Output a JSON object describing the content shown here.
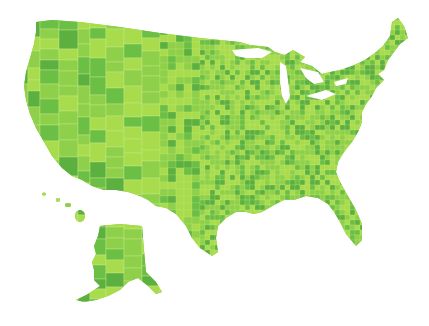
{
  "map": {
    "subject": "United States counties choropleth",
    "colors": {
      "background": "#ffffff",
      "light": "#a8dc4c",
      "mid": "#8fd04a",
      "dark": "#6cbf45",
      "darker": "#5cb040",
      "border": "#c8ec8a"
    },
    "regions": [
      "contiguous-us",
      "alaska",
      "hawaii"
    ]
  }
}
